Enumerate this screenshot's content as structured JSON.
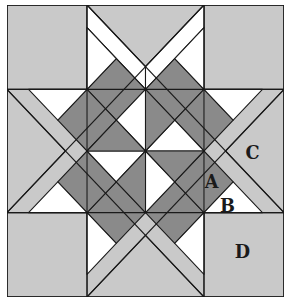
{
  "diagram": {
    "labels": {
      "A": "A",
      "B": "B",
      "C": "C",
      "D": "D"
    },
    "colors": {
      "background_light_gray": "#c9c9c9",
      "diamond_dark_gray": "#8a8a8a",
      "white_fill": "#ffffff",
      "line": "#1a1a1a"
    },
    "pieces": [
      {
        "id": "A",
        "description": "diamond (parallelogram) piece"
      },
      {
        "id": "B",
        "description": "small triangle piece"
      },
      {
        "id": "C",
        "description": "large triangle piece"
      },
      {
        "id": "D",
        "description": "corner square piece"
      }
    ]
  }
}
